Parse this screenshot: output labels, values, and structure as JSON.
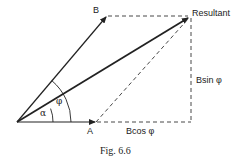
{
  "diagram": {
    "labels": {
      "b": "B",
      "a": "A",
      "resultant": "Resultant",
      "bsin": "Bsin φ",
      "bcos": "Bcos φ",
      "alpha": "α",
      "phi": "φ"
    },
    "caption": "Fig. 6.6",
    "colors": {
      "line": "#222222",
      "background": "#ffffff"
    }
  }
}
